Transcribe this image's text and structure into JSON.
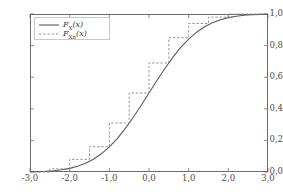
{
  "chart_data": {
    "type": "line",
    "title": "",
    "xlabel": "",
    "ylabel": "",
    "xlim": [
      -3.0,
      3.0
    ],
    "ylim": [
      0.0,
      1.0
    ],
    "grid": false,
    "legend_position": "top-left",
    "decimal_separator": ",",
    "x_ticks": [
      -3.0,
      -2.0,
      -1.0,
      0.0,
      1.0,
      2.0,
      3.0
    ],
    "x_tick_labels": [
      "-3,0",
      "-2,0",
      "-1,0",
      "0,0",
      "1,0",
      "2,0",
      "3,0"
    ],
    "y_ticks": [
      0.0,
      0.2,
      0.4,
      0.6,
      0.8,
      1.0
    ],
    "y_tick_labels": [
      "0,0",
      "0,2",
      "0,4",
      "0,6",
      "0,8",
      "1,0"
    ],
    "series": [
      {
        "name": "F_X(x)",
        "label_main": "F",
        "label_sub": "X",
        "label_arg": "(x)",
        "style": "solid",
        "color": "#5a5a5a",
        "description": "Standard normal cumulative distribution function",
        "x": [
          -3.0,
          -2.8,
          -2.6,
          -2.4,
          -2.2,
          -2.0,
          -1.8,
          -1.6,
          -1.4,
          -1.2,
          -1.0,
          -0.8,
          -0.6,
          -0.4,
          -0.2,
          0.0,
          0.2,
          0.4,
          0.6,
          0.8,
          1.0,
          1.2,
          1.4,
          1.6,
          1.8,
          2.0,
          2.2,
          2.4,
          2.6,
          2.8,
          3.0
        ],
        "y": [
          0.0013,
          0.0026,
          0.0047,
          0.0082,
          0.0139,
          0.0228,
          0.0359,
          0.0548,
          0.0808,
          0.1151,
          0.1587,
          0.2119,
          0.2743,
          0.3446,
          0.4207,
          0.5,
          0.5793,
          0.6554,
          0.7257,
          0.7881,
          0.8413,
          0.8849,
          0.9192,
          0.9452,
          0.9641,
          0.9772,
          0.9861,
          0.9918,
          0.9953,
          0.9974,
          0.9987
        ]
      },
      {
        "name": "F_Xn(x)",
        "label_main": "F",
        "label_sub": "Xn",
        "label_arg": "(x)",
        "style": "dashed",
        "color": "#8a8a8a",
        "description": "Empirical cumulative distribution function (step function)",
        "step_x": [
          -3.0,
          -2.5,
          -2.0,
          -1.5,
          -1.0,
          -0.5,
          0.0,
          0.5,
          1.0,
          1.5,
          2.0,
          3.0
        ],
        "step_y": [
          0.0,
          0.02,
          0.08,
          0.16,
          0.31,
          0.5,
          0.69,
          0.85,
          0.94,
          0.98,
          1.0,
          1.0
        ]
      }
    ]
  }
}
